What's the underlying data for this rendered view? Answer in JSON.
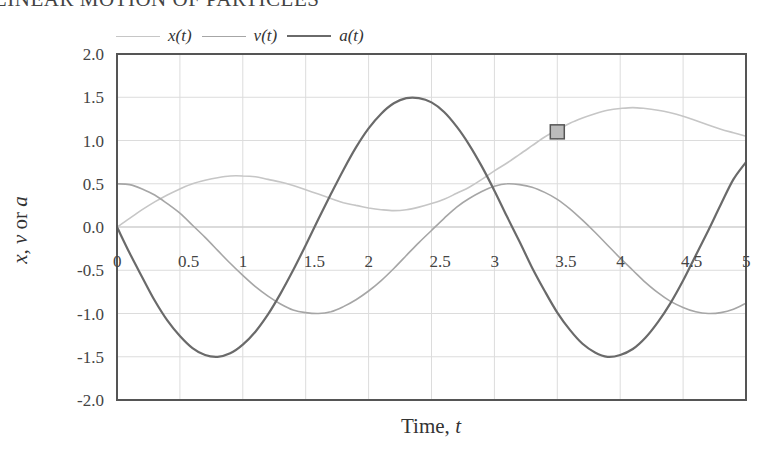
{
  "header": {
    "text": "LINEAR MOTION OF PARTICLES"
  },
  "chart_data": {
    "type": "line",
    "title": "",
    "xlabel": "Time, t",
    "ylabel": "x, v or a",
    "xlim": [
      0,
      5
    ],
    "ylim": [
      -2.0,
      2.0
    ],
    "grid": true,
    "legend_position": "top",
    "x_ticks": [
      "0",
      "0.5",
      "1",
      "1.5",
      "2",
      "2.5",
      "3",
      "3.5",
      "4",
      "4.5",
      "5"
    ],
    "y_ticks": [
      "2.0",
      "1.5",
      "1.0",
      "0.5",
      "0.0",
      "-0.5",
      "-1.0",
      "-1.5",
      "-2.0"
    ],
    "x": [
      0,
      0.1,
      0.2,
      0.3,
      0.4,
      0.5,
      0.6,
      0.7,
      0.8,
      0.9,
      1.0,
      1.1,
      1.2,
      1.3,
      1.4,
      1.5,
      1.6,
      1.7,
      1.8,
      1.9,
      2.0,
      2.1,
      2.2,
      2.3,
      2.4,
      2.5,
      2.6,
      2.7,
      2.8,
      2.9,
      3.0,
      3.1,
      3.2,
      3.3,
      3.4,
      3.5,
      3.6,
      3.7,
      3.8,
      3.9,
      4.0,
      4.1,
      4.2,
      4.3,
      4.4,
      4.5,
      4.6,
      4.7,
      4.8,
      4.9,
      5.0
    ],
    "series": [
      {
        "name": "x(t)",
        "color": "#c6c6c6",
        "values": [
          0,
          0.1,
          0.2,
          0.29,
          0.37,
          0.44,
          0.5,
          0.54,
          0.57,
          0.59,
          0.59,
          0.58,
          0.55,
          0.52,
          0.48,
          0.43,
          0.38,
          0.33,
          0.28,
          0.25,
          0.22,
          0.2,
          0.19,
          0.2,
          0.23,
          0.27,
          0.32,
          0.39,
          0.46,
          0.55,
          0.65,
          0.74,
          0.84,
          0.94,
          1.04,
          1.12,
          1.2,
          1.26,
          1.31,
          1.35,
          1.37,
          1.38,
          1.37,
          1.35,
          1.32,
          1.28,
          1.23,
          1.18,
          1.13,
          1.09,
          1.05
        ]
      },
      {
        "name": "v(t)",
        "color": "#a6a6a6",
        "values": [
          0.5,
          0.49,
          0.44,
          0.37,
          0.27,
          0.16,
          0.02,
          -0.12,
          -0.27,
          -0.42,
          -0.56,
          -0.69,
          -0.8,
          -0.89,
          -0.96,
          -0.99,
          -1.0,
          -0.98,
          -0.92,
          -0.84,
          -0.74,
          -0.62,
          -0.48,
          -0.33,
          -0.18,
          -0.04,
          0.1,
          0.23,
          0.33,
          0.41,
          0.47,
          0.5,
          0.49,
          0.46,
          0.4,
          0.32,
          0.21,
          0.08,
          -0.06,
          -0.21,
          -0.36,
          -0.5,
          -0.64,
          -0.76,
          -0.86,
          -0.93,
          -0.98,
          -1.0,
          -0.99,
          -0.95,
          -0.88
        ]
      },
      {
        "name": "a(t)",
        "color": "#6a6a6a",
        "values": [
          0,
          -0.3,
          -0.58,
          -0.85,
          -1.08,
          -1.26,
          -1.4,
          -1.48,
          -1.5,
          -1.46,
          -1.36,
          -1.21,
          -1.01,
          -0.77,
          -0.5,
          -0.21,
          0.09,
          0.38,
          0.66,
          0.92,
          1.14,
          1.31,
          1.43,
          1.49,
          1.49,
          1.44,
          1.33,
          1.16,
          0.95,
          0.7,
          0.42,
          0.12,
          -0.17,
          -0.47,
          -0.74,
          -0.99,
          -1.19,
          -1.35,
          -1.45,
          -1.5,
          -1.48,
          -1.41,
          -1.28,
          -1.1,
          -0.88,
          -0.62,
          -0.33,
          -0.04,
          0.26,
          0.55,
          0.75
        ]
      }
    ],
    "markers": [
      {
        "series": "x(t)",
        "t": 3.5,
        "value": 1.1,
        "shape": "square",
        "fill": "#bbbbbb",
        "stroke": "#555555"
      }
    ]
  },
  "legend": {
    "items": [
      {
        "label": "x(t)",
        "color": "#c6c6c6"
      },
      {
        "label": "v(t)",
        "color": "#a6a6a6"
      },
      {
        "label": "a(t)",
        "color": "#6a6a6a"
      }
    ]
  },
  "axes": {
    "ylabel_parts": [
      "x",
      ", ",
      "v",
      " or ",
      "a"
    ],
    "xlabel_parts": [
      "Time, ",
      "t"
    ]
  }
}
